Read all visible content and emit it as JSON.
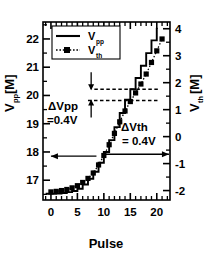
{
  "chart_data": {
    "type": "line",
    "title": "",
    "xlabel": "Pulse",
    "ylabel_left": "V_pp [M]",
    "ylabel_right": "V_th [M]",
    "ylabel_left_main": "V",
    "ylabel_left_sub": "pp",
    "ylabel_left_unit": "[M]",
    "ylabel_right_main": "V",
    "ylabel_right_sub": "th",
    "ylabel_right_unit": "[M]",
    "xlim": [
      -1.5,
      22.5
    ],
    "ylim_left": [
      16.3,
      22.6
    ],
    "ylim_right": [
      -2.35,
      4.25
    ],
    "xticks": [
      0,
      5,
      10,
      15,
      20
    ],
    "xticklabels": [
      "0",
      "5",
      "10",
      "15",
      "20"
    ],
    "yticks_left": [
      17,
      18,
      19,
      20,
      21,
      22
    ],
    "yticklabels_left": [
      "17",
      "18",
      "19",
      "20",
      "21",
      "22"
    ],
    "yticks_right": [
      -2,
      -1,
      0,
      1,
      2,
      3,
      4
    ],
    "yticklabels_right": [
      "-2",
      "-1",
      "0",
      "1",
      "2",
      "3",
      "4"
    ],
    "grid": false,
    "minor_ticks": true,
    "legend_position": "upper-left",
    "series": [
      {
        "name": "V_pp",
        "label_main": "V",
        "label_sub": "pp",
        "style": "solid-staircase",
        "marker": "none",
        "axis": "left",
        "color": "#000000",
        "x": [
          -1.0,
          0,
          1,
          2,
          3,
          4,
          5,
          6,
          7,
          8,
          9,
          10,
          11,
          12,
          13,
          14,
          15,
          16,
          17,
          18,
          19,
          20
        ],
        "y": [
          16.52,
          16.52,
          16.53,
          16.55,
          16.58,
          16.62,
          16.7,
          16.85,
          17.05,
          17.3,
          17.62,
          18.0,
          18.42,
          18.88,
          19.38,
          19.85,
          20.22,
          20.62,
          21.05,
          21.5,
          21.95,
          22.4
        ]
      },
      {
        "name": "V_th",
        "label_main": "V",
        "label_sub": "th",
        "style": "dotted",
        "marker": "square",
        "axis": "right",
        "color": "#000000",
        "x": [
          0,
          1,
          2,
          3,
          4,
          5,
          6,
          7,
          8,
          9,
          10,
          11,
          12,
          13,
          14,
          15,
          16,
          17,
          18,
          19,
          20,
          21
        ],
        "y": [
          -2.05,
          -2.03,
          -2.0,
          -1.96,
          -1.9,
          -1.82,
          -1.7,
          -1.55,
          -1.35,
          -1.05,
          -0.7,
          -0.3,
          0.12,
          0.55,
          0.95,
          1.3,
          1.62,
          1.95,
          2.32,
          2.75,
          3.18,
          3.62
        ]
      }
    ],
    "annotations": [
      {
        "name": "delta-vpp",
        "line1": "ΔVpp",
        "line2": "=0.4V",
        "x": 5.2,
        "y_left": 20.25
      },
      {
        "name": "delta-vth",
        "line1": "ΔVth",
        "line2": "= 0.4V",
        "x": 14.2,
        "y_left": 19.55
      }
    ],
    "guide_lines": [
      {
        "name": "dashed-upper",
        "y_left": 20.22,
        "x_from": 8.2,
        "x_to": 20.2
      },
      {
        "name": "dashed-lower",
        "y_left": 19.82,
        "x_from": 7.0,
        "x_to": 20.2
      }
    ],
    "axis_arrows": [
      {
        "name": "left-axis-arrow",
        "direction": "left",
        "y_left": 17.85,
        "x_from": 8.6,
        "x_to": 0.0
      },
      {
        "name": "right-axis-arrow",
        "direction": "right",
        "y_left": 17.92,
        "x_from": 10.2,
        "x_to": 22.3
      }
    ]
  }
}
